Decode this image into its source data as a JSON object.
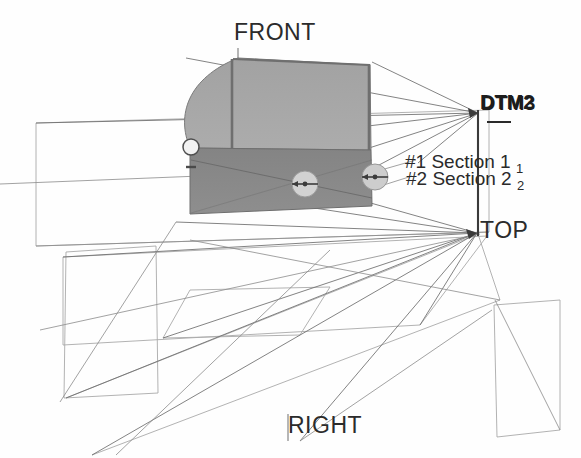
{
  "scene": {
    "title": "3D CAD model with datum planes and cross-section markers",
    "background_color": "#ffffff",
    "line_color": "#555555",
    "faint_line_color": "#9a9a9a",
    "solid_upper_color": "#a8a8a8",
    "solid_lower_color": "#8a8a8a",
    "marker_fill_color": "#d4d4d4"
  },
  "view_labels": {
    "front": "FRONT",
    "top": "TOP",
    "right": "RIGHT"
  },
  "datum_labels": {
    "dtm_overlapped": "DTM3",
    "dtm_underlay": "DTM2"
  },
  "sections": [
    {
      "id": "#1",
      "name": "Section 1",
      "suffix": "1"
    },
    {
      "id": "#2",
      "name": "Section 2",
      "suffix": "2"
    }
  ],
  "section_markers": [
    {
      "name": "section-marker-1",
      "cx": 305,
      "cy": 184,
      "r": 13
    },
    {
      "name": "section-marker-2",
      "cx": 375,
      "cy": 177,
      "r": 13
    }
  ],
  "vertex_marker": {
    "name": "vertex-point",
    "cx": 191,
    "cy": 147,
    "r": 8
  },
  "anchors": {
    "dtm_point": {
      "x": 478,
      "y": 113
    },
    "top_point": {
      "x": 478,
      "y": 233
    }
  }
}
